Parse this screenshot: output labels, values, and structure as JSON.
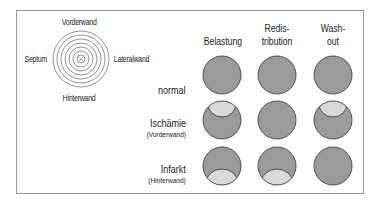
{
  "bullseye": {
    "labels": {
      "top": "Vorderwand",
      "left": "Septum",
      "right": "Lateralwand",
      "bottom": "Hinterwand"
    },
    "rings": 7
  },
  "columns": [
    {
      "label": "Belastung"
    },
    {
      "label": "Redis-\ntribution",
      "line1": "Redis-",
      "line2": "tribution"
    },
    {
      "label": "Wash-\nout",
      "line1": "Wash-",
      "line2": "out"
    }
  ],
  "rows": [
    {
      "label": "normal",
      "sublabel": "",
      "defects": [
        "none",
        "none",
        "none"
      ]
    },
    {
      "label": "Ischämie",
      "sublabel": "(Vorderwand)",
      "defects": [
        "top",
        "none",
        "top"
      ]
    },
    {
      "label": "Infarkt",
      "sublabel": "(Hinterwand)",
      "defects": [
        "bottom",
        "bottom",
        "none"
      ]
    }
  ],
  "colors": {
    "perfused": "#9b9b9b",
    "defect": "#d9d9d9",
    "outline": "#4d4d4d",
    "frame": "#9a9a9a"
  }
}
